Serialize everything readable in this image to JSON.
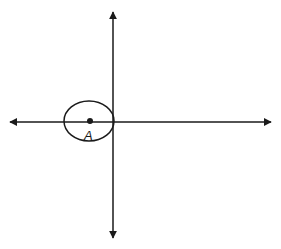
{
  "diagram": {
    "type": "coordinate-axes-with-ellipse",
    "colors": {
      "stroke": "#1a1a1a",
      "background": "#ffffff"
    },
    "axes": {
      "horizontal": {
        "x1": 10,
        "x2": 271,
        "y": 122,
        "arrows": "both"
      },
      "vertical": {
        "x": 113,
        "y1": 12,
        "y2": 238,
        "arrows": "both"
      }
    },
    "ellipse": {
      "cx": 89,
      "cy": 121,
      "rx": 25,
      "ry": 20
    },
    "point": {
      "label": "A",
      "cx": 90,
      "cy": 121,
      "r": 3
    }
  }
}
